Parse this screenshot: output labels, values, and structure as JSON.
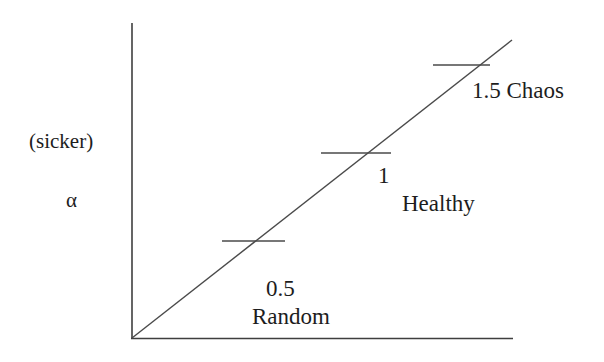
{
  "figure": {
    "title": "",
    "axis_label_y_top": "(sicker)",
    "axis_label_y_symbol": "α",
    "annotations": {
      "chaos": "1.5 Chaos",
      "healthy_value": "1",
      "healthy": "Healthy",
      "random_value": "0.5",
      "random": "Random"
    },
    "colors": {
      "line": "#4a4a4a",
      "axis": "#3f3f3f",
      "text": "#1d1d1d",
      "background": "#ffffff"
    }
  },
  "chart_data": {
    "type": "line",
    "title": "",
    "xlabel": "",
    "ylabel": "α",
    "ylabel_note": "(sicker)",
    "grid": false,
    "legend": null,
    "axes": {
      "x_axis": {
        "x1": 132,
        "y1": 338,
        "x2": 513,
        "y2": 338,
        "arrow": false,
        "ticks": [],
        "tick_labels": []
      },
      "y_axis": {
        "x1": 132,
        "y1": 23,
        "x2": 132,
        "y2": 338,
        "arrow": false,
        "ticks": [],
        "tick_labels": []
      }
    },
    "series": [
      {
        "name": "alpha trend",
        "type": "line",
        "points": [
          {
            "x": 132,
            "y": 338
          },
          {
            "x": 512,
            "y": 40
          }
        ],
        "style": "solid"
      }
    ],
    "markers": [
      {
        "label": "0.5",
        "sublabel": "Random",
        "value": 0.5,
        "tick_x1": 222,
        "tick_x2": 285,
        "tick_y": 241
      },
      {
        "label": "1",
        "sublabel": "Healthy",
        "value": 1.0,
        "tick_x1": 321,
        "tick_x2": 391,
        "tick_y": 153
      },
      {
        "label": "1.5",
        "sublabel": "Chaos",
        "value": 1.5,
        "tick_x1": 433,
        "tick_x2": 490,
        "tick_y": 65
      }
    ],
    "annotations": [
      {
        "text": "1.5 Chaos",
        "x": 472,
        "y": 96
      },
      {
        "text": "1",
        "x": 378,
        "y": 181
      },
      {
        "text": "Healthy",
        "x": 402,
        "y": 209
      },
      {
        "text": "0.5",
        "x": 266,
        "y": 294
      },
      {
        "text": "Random",
        "x": 252,
        "y": 322
      },
      {
        "text": "(sicker)",
        "x": 29,
        "y": 148
      },
      {
        "text": "α",
        "x": 66,
        "y": 207
      }
    ]
  }
}
